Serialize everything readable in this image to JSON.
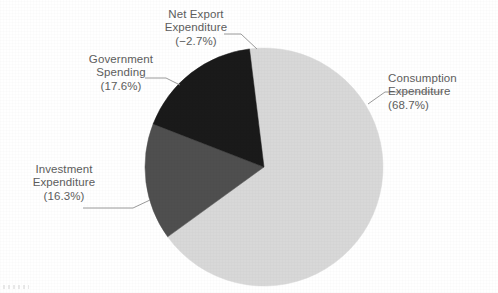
{
  "chart_data": {
    "type": "pie",
    "title": "",
    "subtitle": "",
    "xlabel": "",
    "ylabel": "",
    "legend_position": "callout-labels",
    "grid": false,
    "note": "Net Export Expenditure is negative (-2.7%) so it is not drawn as a wedge; the three positive components are drawn clockwise from near 12 o'clock.",
    "categories": [
      "Consumption Expenditure",
      "Investment Expenditure",
      "Government Spending",
      "Net Export Expenditure"
    ],
    "values": [
      68.7,
      16.3,
      17.6,
      -2.7
    ],
    "value_labels": [
      "(68.7%)",
      "(16.3%)",
      "(17.6%)",
      "(−2.7%)"
    ],
    "slices": [
      {
        "name": "Consumption Expenditure",
        "label_line1": "Consumption",
        "label_line2": "Expenditure",
        "label_line3": "(68.7%)",
        "value": 68.7,
        "color": "#d8d8d8",
        "drawn": true,
        "start_angle_deg": -7,
        "end_angle_deg": 240.3
      },
      {
        "name": "Investment Expenditure",
        "label_line1": "Investment",
        "label_line2": "Expenditure",
        "label_line3": "(16.3%)",
        "value": 16.3,
        "color": "#4f4f4f",
        "drawn": true,
        "start_angle_deg": 240.3,
        "end_angle_deg": 296.0
      },
      {
        "name": "Government Spending",
        "label_line1": "Government",
        "label_line2": "Spending",
        "label_line3": "(17.6%)",
        "value": 17.6,
        "color": "#1a1a1a",
        "drawn": true,
        "start_angle_deg": 296.0,
        "end_angle_deg": 353.0
      },
      {
        "name": "Net Export Expenditure",
        "label_line1": "Net Export",
        "label_line2": "Expenditure",
        "label_line3": "(−2.7%)",
        "value": -2.7,
        "color": "#ffffff",
        "drawn": false
      }
    ],
    "colors": {
      "consumption": "#d8d8d8",
      "investment": "#4f4f4f",
      "government": "#1a1a1a",
      "background": "#ffffff",
      "label_text": "#5d5d5d",
      "leader_line": "#8a8a8a"
    },
    "geometry": {
      "center_x": 264,
      "center_y": 167,
      "radius": 119
    }
  }
}
